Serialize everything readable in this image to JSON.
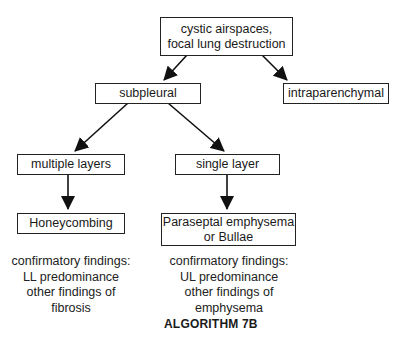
{
  "diagram": {
    "title": "ALGORITHM 7B",
    "nodes": {
      "root": "cystic airspaces,\nfocal lung destruction",
      "subpleural": "subpleural",
      "intraparenchymal": "intraparenchymal",
      "multiple_layers": "multiple layers",
      "single_layer": "single layer",
      "honeycombing": "Honeycombing",
      "paraseptal": "Paraseptal emphysema\nor Bullae"
    },
    "notes": {
      "honeycombing": "confirmatory findings:\nLL predominance\nother findings of\nfibrosis",
      "paraseptal": "confirmatory findings:\nUL predominance\nother findings of\nemphysema"
    },
    "edges": [
      {
        "from": "root",
        "to": "subpleural"
      },
      {
        "from": "root",
        "to": "intraparenchymal"
      },
      {
        "from": "subpleural",
        "to": "multiple_layers"
      },
      {
        "from": "subpleural",
        "to": "single_layer"
      },
      {
        "from": "multiple_layers",
        "to": "honeycombing"
      },
      {
        "from": "single_layer",
        "to": "paraseptal"
      }
    ]
  }
}
